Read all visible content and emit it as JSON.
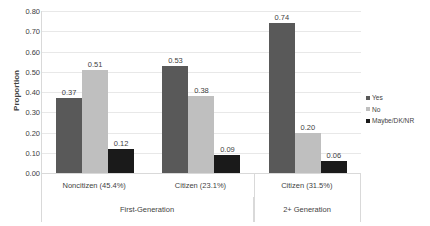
{
  "chart_data": {
    "type": "bar",
    "title": "",
    "subtitle": "",
    "xlabel": "",
    "ylabel": "Proportion",
    "ylim": [
      0.0,
      0.8
    ],
    "ytick_step": 0.1,
    "ytick_labels": [
      "0.80",
      "0.70",
      "0.60",
      "0.50",
      "0.40",
      "0.30",
      "0.20",
      "0.10",
      "0.00"
    ],
    "ytick_values": [
      0.8,
      0.7,
      0.6,
      0.5,
      0.4,
      0.3,
      0.2,
      0.1,
      0.0
    ],
    "grid": true,
    "legend_position": "right",
    "categories": [
      "Noncitizen (45.4%)",
      "Citizen (23.1%)",
      "Citizen (31.5%)"
    ],
    "category_groups": [
      {
        "label": "First-Generation",
        "span": 2
      },
      {
        "label": "2+ Generation",
        "span": 1
      }
    ],
    "series": [
      {
        "name": "Yes",
        "color": "#595959",
        "values": [
          0.37,
          0.53,
          0.74
        ],
        "labels": [
          "0.37",
          "0.53",
          "0.74"
        ]
      },
      {
        "name": "No",
        "color": "#bfbfbf",
        "values": [
          0.51,
          0.38,
          0.2
        ],
        "labels": [
          "0.51",
          "0.38",
          "0.20"
        ]
      },
      {
        "name": "Maybe/DK/NR",
        "color": "#1a1a1a",
        "values": [
          0.12,
          0.09,
          0.06
        ],
        "labels": [
          "0.12",
          "0.09",
          "0.06"
        ]
      }
    ]
  },
  "axis": {
    "y_title": "Proportion"
  },
  "legend": {
    "items": [
      {
        "label": "Yes",
        "marker": "square-marker-dark-gray"
      },
      {
        "label": "No",
        "marker": "square-marker-light-gray"
      },
      {
        "label": "Maybe/DK/NR",
        "marker": "square-marker-black"
      }
    ]
  }
}
